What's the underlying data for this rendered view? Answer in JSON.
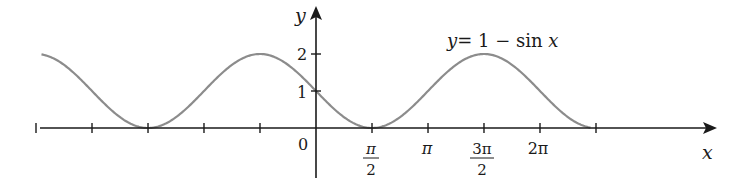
{
  "chart_data": {
    "type": "line",
    "title": "",
    "equation_label": "y = 1 − sin x",
    "equation_parts": {
      "y": "y",
      "eq": "= 1 − sin ",
      "x": "x"
    },
    "xlabel": "x",
    "ylabel": "y",
    "origin_label": "0",
    "function": "1 - sin(x)",
    "x_range_radians": [
      -7.7,
      7.7
    ],
    "ylim": [
      0,
      2
    ],
    "x_tick_labels": [
      {
        "value": "π/2",
        "num": "π",
        "den": "2"
      },
      {
        "value": "π",
        "text": "π"
      },
      {
        "value": "3π/2",
        "num": "3π",
        "den": "2"
      },
      {
        "value": "2π",
        "text": "2π"
      }
    ],
    "x_ticks_radians": [
      -7.854,
      -6.283,
      -4.712,
      -3.142,
      -1.571,
      0,
      1.571,
      3.142,
      4.712,
      6.283,
      7.854
    ],
    "y_ticks": [
      1,
      2
    ],
    "y_tick_labels": [
      "1",
      "2"
    ],
    "grid": false,
    "legend": "none",
    "series": [
      {
        "name": "y = 1 − sin x",
        "x": [
          -4.712,
          -3.142,
          -1.571,
          0,
          1.571,
          3.142,
          4.712,
          6.283,
          7.854
        ],
        "values": [
          0,
          1,
          2,
          1,
          0,
          1,
          2,
          1,
          0
        ]
      }
    ],
    "colors": {
      "curve": "#8c8c8c",
      "axes": "#1a1a1a"
    }
  }
}
